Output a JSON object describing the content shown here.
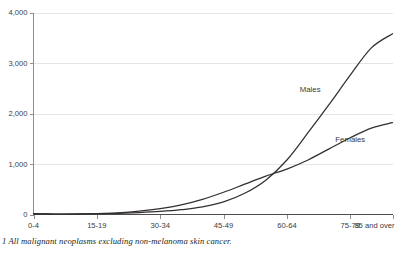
{
  "chart_data": {
    "type": "line",
    "title": "",
    "subtitle": "",
    "xlabel": "",
    "ylabel": "",
    "grid": true,
    "legend_position": "inline-annotation",
    "xlim": [
      0,
      17
    ],
    "ylim": [
      0,
      4000
    ],
    "y_ticks": [
      0,
      1000,
      2000,
      3000,
      4000
    ],
    "y_tick_labels": [
      "0",
      "1,000",
      "2,000",
      "3,000",
      "4,000"
    ],
    "categories": [
      "0-4",
      "5-9",
      "10-14",
      "15-19",
      "20-24",
      "25-29",
      "30-34",
      "35-39",
      "40-44",
      "45-49",
      "50-54",
      "55-59",
      "60-64",
      "65-69",
      "70-74",
      "75-79",
      "80-84",
      "85 and over"
    ],
    "x_tick_labels": [
      "0-4",
      "15-19",
      "30-34",
      "45-49",
      "60-64",
      "75-79",
      "85 and over"
    ],
    "x_tick_indices": [
      0,
      3,
      6,
      9,
      12,
      15,
      17
    ],
    "series": [
      {
        "name": "Males",
        "color": "#332f2e",
        "values": [
          16,
          10,
          11,
          16,
          24,
          38,
          60,
          95,
          150,
          250,
          420,
          680,
          1080,
          1620,
          2180,
          2760,
          3300,
          3580
        ],
        "label_x_index": 13.1,
        "label_y_value": 2430
      },
      {
        "name": "Females",
        "color": "#332f2e",
        "values": [
          14,
          9,
          10,
          17,
          33,
          65,
          115,
          190,
          300,
          440,
          600,
          760,
          900,
          1080,
          1300,
          1520,
          1710,
          1820
        ],
        "label_x_index": 15.0,
        "label_y_value": 1430
      }
    ]
  },
  "footnote": {
    "text": "1 All malignant neoplasms excluding non-melanoma skin cancer."
  },
  "colors": {
    "line": "#332f2e",
    "grid": "#e6e6e6",
    "axis": "#8f8f8f",
    "text": "#3b3b3b",
    "background": "#ffffff"
  }
}
